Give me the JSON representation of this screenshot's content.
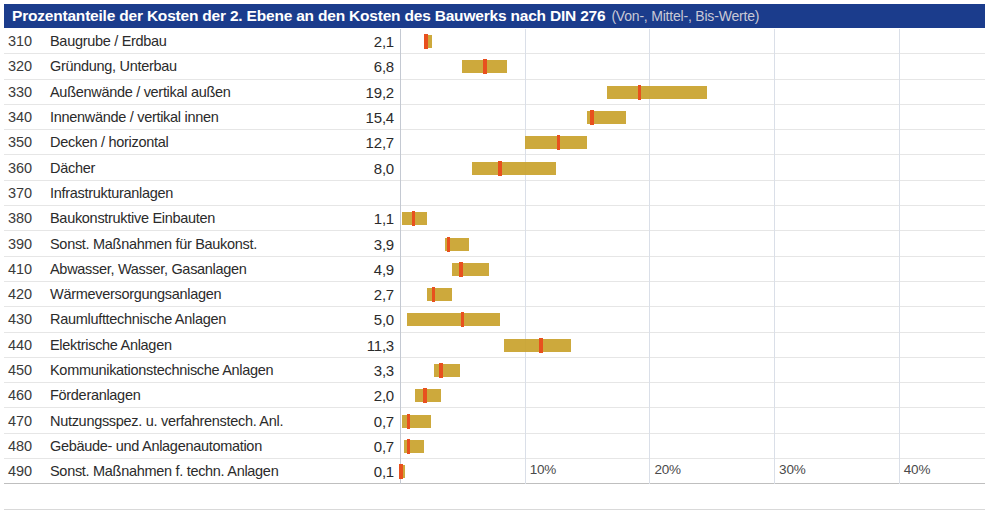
{
  "header": {
    "title": "Prozentanteile der Kosten der 2. Ebene an den Kosten des Bauwerks nach DIN 276",
    "subtitle": "(Von-, Mittel-, Bis-Werte)",
    "bar_color": "#1b3c8c",
    "title_color": "#ffffff",
    "subtitle_color": "#c9c9d6"
  },
  "colors": {
    "range_bar": "#c9a22b",
    "mid_marker": "#e8501e",
    "gridline": "#dadfe8",
    "row_separator": "#e6e6e6"
  },
  "chart_data": {
    "type": "bar",
    "subtype": "range-with-midpoint (floating bar / box)",
    "title": "Prozentanteile der Kosten der 2. Ebene an den Kosten des Bauwerks nach DIN 276",
    "subtitle": "(Von-, Mittel-, Bis-Werte)",
    "xlabel": "",
    "ylabel": "",
    "xlim": [
      0,
      47
    ],
    "xticks": [
      10,
      20,
      30,
      40
    ],
    "xtick_labels": [
      "10%",
      "20%",
      "30%",
      "40%"
    ],
    "grid": true,
    "legend": "none",
    "orientation": "horizontal",
    "value_column_header": "Mittel",
    "categories": [
      "Baugrube / Erdbau",
      "Gründung, Unterbau",
      "Außenwände / vertikal außen",
      "Innenwände / vertikal innen",
      "Decken / horizontal",
      "Dächer",
      "Infrastrukturanlagen",
      "Baukonstruktive Einbauten",
      "Sonst. Maßnahmen für Baukonst.",
      "Abwasser, Wasser, Gasanlagen",
      "Wärmeversorgungsanlagen",
      "Raumlufttechnische Anlagen",
      "Elektrische Anlagen",
      "Kommunikationstechnische Anlagen",
      "Förderanlagen",
      "Nutzungsspez. u. verfahrenstech. Anl.",
      "Gebäude- und Anlagenautomation",
      "Sonst. Maßnahmen f. techn. Anlagen"
    ],
    "codes": [
      "310",
      "320",
      "330",
      "340",
      "350",
      "360",
      "370",
      "380",
      "390",
      "410",
      "420",
      "430",
      "440",
      "450",
      "460",
      "470",
      "480",
      "490"
    ],
    "values": [
      2.1,
      6.8,
      19.2,
      15.4,
      12.7,
      8.0,
      null,
      1.1,
      3.9,
      4.9,
      2.7,
      5.0,
      11.3,
      3.3,
      2.0,
      0.7,
      0.7,
      0.1
    ],
    "von": [
      1.9,
      5.0,
      16.6,
      15.0,
      10.0,
      5.8,
      null,
      0.2,
      3.6,
      4.2,
      2.2,
      0.6,
      8.3,
      2.7,
      1.2,
      0.2,
      0.3,
      0.0
    ],
    "bis": [
      2.6,
      8.6,
      24.6,
      18.1,
      15.0,
      12.5,
      null,
      2.2,
      5.5,
      7.1,
      4.2,
      8.0,
      13.7,
      4.8,
      3.3,
      2.5,
      1.9,
      0.4
    ]
  },
  "rows": [
    {
      "code": "310",
      "label": "Baugrube / Erdbau",
      "value": "2,1",
      "von": 1.9,
      "mid": 2.1,
      "bis": 2.6
    },
    {
      "code": "320",
      "label": "Gründung, Unterbau",
      "value": "6,8",
      "von": 5.0,
      "mid": 6.8,
      "bis": 8.6
    },
    {
      "code": "330",
      "label": "Außenwände / vertikal außen",
      "value": "19,2",
      "von": 16.6,
      "mid": 19.2,
      "bis": 24.6
    },
    {
      "code": "340",
      "label": "Innenwände / vertikal innen",
      "value": "15,4",
      "von": 15.0,
      "mid": 15.4,
      "bis": 18.1
    },
    {
      "code": "350",
      "label": "Decken / horizontal",
      "value": "12,7",
      "von": 10.0,
      "mid": 12.7,
      "bis": 15.0
    },
    {
      "code": "360",
      "label": "Dächer",
      "value": "8,0",
      "von": 5.8,
      "mid": 8.0,
      "bis": 12.5
    },
    {
      "code": "370",
      "label": "Infrastrukturanlagen",
      "value": "",
      "von": null,
      "mid": null,
      "bis": null
    },
    {
      "code": "380",
      "label": "Baukonstruktive Einbauten",
      "value": "1,1",
      "von": 0.2,
      "mid": 1.1,
      "bis": 2.2
    },
    {
      "code": "390",
      "label": "Sonst. Maßnahmen für Baukonst.",
      "value": "3,9",
      "von": 3.6,
      "mid": 3.9,
      "bis": 5.5
    },
    {
      "code": "410",
      "label": "Abwasser, Wasser, Gasanlagen",
      "value": "4,9",
      "von": 4.2,
      "mid": 4.9,
      "bis": 7.1
    },
    {
      "code": "420",
      "label": "Wärmeversorgungsanlagen",
      "value": "2,7",
      "von": 2.2,
      "mid": 2.7,
      "bis": 4.2
    },
    {
      "code": "430",
      "label": "Raumlufttechnische Anlagen",
      "value": "5,0",
      "von": 0.6,
      "mid": 5.0,
      "bis": 8.0
    },
    {
      "code": "440",
      "label": "Elektrische Anlagen",
      "value": "11,3",
      "von": 8.3,
      "mid": 11.3,
      "bis": 13.7
    },
    {
      "code": "450",
      "label": "Kommunikationstechnische Anlagen",
      "value": "3,3",
      "von": 2.7,
      "mid": 3.3,
      "bis": 4.8
    },
    {
      "code": "460",
      "label": "Förderanlagen",
      "value": "2,0",
      "von": 1.2,
      "mid": 2.0,
      "bis": 3.3
    },
    {
      "code": "470",
      "label": "Nutzungsspez. u. verfahrenstech. Anl.",
      "value": "0,7",
      "von": 0.2,
      "mid": 0.7,
      "bis": 2.5
    },
    {
      "code": "480",
      "label": "Gebäude- und Anlagenautomation",
      "value": "0,7",
      "von": 0.3,
      "mid": 0.7,
      "bis": 1.9
    },
    {
      "code": "490",
      "label": "Sonst. Maßnahmen f. techn. Anlagen",
      "value": "0,1",
      "von": 0.0,
      "mid": 0.1,
      "bis": 0.4
    }
  ],
  "axis": {
    "ticks": [
      {
        "value": 10,
        "label": "10%"
      },
      {
        "value": 20,
        "label": "20%"
      },
      {
        "value": 30,
        "label": "30%"
      },
      {
        "value": 40,
        "label": "40%"
      }
    ]
  }
}
